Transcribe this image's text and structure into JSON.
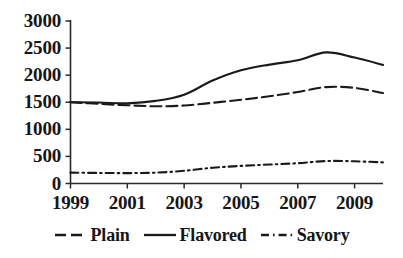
{
  "chart_data": {
    "type": "line",
    "title": "",
    "subtitle": "",
    "xlabel": "",
    "ylabel": "",
    "x": [
      1999,
      2000,
      2001,
      2002,
      2003,
      2004,
      2005,
      2006,
      2007,
      2008,
      2009,
      2010
    ],
    "xlim": [
      1999,
      2010
    ],
    "ylim": [
      0,
      3000
    ],
    "grid": false,
    "legend_position": "bottom-center",
    "xtick_labels": [
      "1999",
      "2001",
      "2003",
      "2005",
      "2007",
      "2009"
    ],
    "xtick_values": [
      1999,
      2001,
      2003,
      2005,
      2007,
      2009
    ],
    "ytick_labels": [
      "3000",
      "2500",
      "2000",
      "1500",
      "1000",
      "500",
      "0"
    ],
    "ytick_values": [
      3000,
      2500,
      2000,
      1500,
      1000,
      500,
      0
    ],
    "series": [
      {
        "name": "Plain",
        "style": "dashed",
        "color": "#1a1a1a",
        "values": [
          1500,
          1470,
          1445,
          1425,
          1440,
          1490,
          1545,
          1610,
          1690,
          1780,
          1765,
          1670
        ]
      },
      {
        "name": "Flavored",
        "style": "solid",
        "color": "#1a1a1a",
        "values": [
          1500,
          1495,
          1480,
          1525,
          1640,
          1900,
          2090,
          2195,
          2275,
          2420,
          2325,
          2190
        ]
      },
      {
        "name": "Savory",
        "style": "dash-dot",
        "color": "#1a1a1a",
        "values": [
          200,
          195,
          192,
          200,
          235,
          290,
          325,
          350,
          375,
          415,
          410,
          390
        ]
      }
    ]
  },
  "legend": {
    "items": [
      {
        "label": "Plain",
        "style": "dashed"
      },
      {
        "label": "Flavored",
        "style": "solid"
      },
      {
        "label": "Savory",
        "style": "dash-dot"
      }
    ]
  },
  "axes": {
    "axis_color": "#2a2a2a"
  }
}
